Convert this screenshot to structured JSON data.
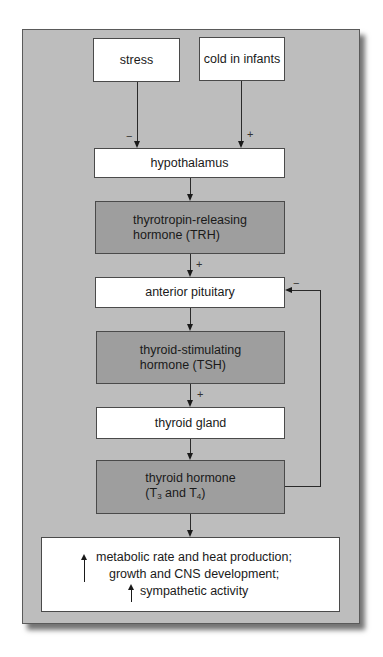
{
  "diagram": {
    "inputs": [
      {
        "label": "stress",
        "effect_sign": "−"
      },
      {
        "label": "cold in infants",
        "effect_sign": "+"
      }
    ],
    "nodes": {
      "hypothalamus": "hypothalamus",
      "trh_line1": "thyrotropin-releasing",
      "trh_line2": "hormone (TRH)",
      "anterior_pituitary": "anterior pituitary",
      "tsh_line1": "thyroid-stimulating",
      "tsh_line2": "hormone (TSH)",
      "thyroid_gland": "thyroid gland",
      "th_line1": "thyroid hormone",
      "th_line2_prefix": "(T",
      "th_sub1": "3",
      "th_mid": " and T",
      "th_sub2": "4",
      "th_suffix": ")"
    },
    "signs": {
      "trh_to_pituitary": "+",
      "tsh_to_thyroid": "+",
      "feedback": "−"
    },
    "effects": {
      "line1": "metabolic rate and heat production;",
      "line2": "growth and CNS development;",
      "line3": "sympathetic activity"
    },
    "colors": {
      "panel": "#bdbdbd",
      "hormone_box": "#9e9e9e",
      "tissue_box": "#ffffff"
    }
  }
}
